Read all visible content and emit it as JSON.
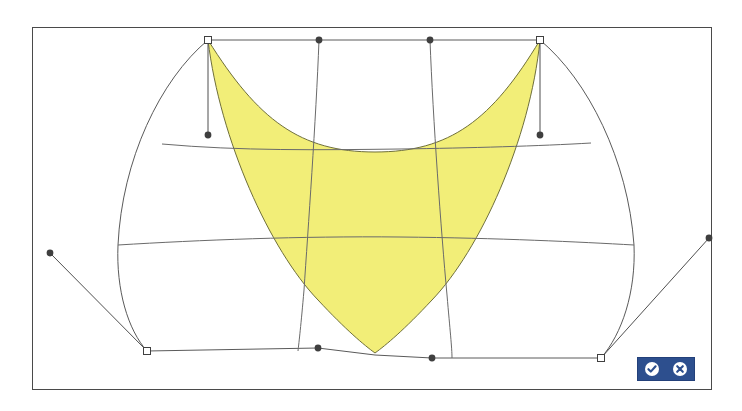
{
  "app": {
    "title": "Surface Patch Editor",
    "canvas_label": "nurbs-surface-canvas"
  },
  "canvas": {
    "frame": {
      "x": 32,
      "y": 27,
      "width": 680,
      "height": 363,
      "border_color": "#4a4a4a"
    },
    "background_color": "#ffffff"
  },
  "toolbar": {
    "name": "confirm-cancel-toolbar",
    "background_color": "#2d4f8e",
    "accept_label": "Accept",
    "accept_icon": "check-circle-icon",
    "cancel_label": "Cancel",
    "cancel_icon": "close-circle-icon",
    "icon_color": "#ffffff"
  },
  "geometry": {
    "selected_patch": {
      "name": "highlighted-surface-patch",
      "fill_color": "#f2ee78",
      "stroke_color": "#6f6f3a",
      "path": "M 208 40 C 258 120 300 152 375 152 C 450 152 492 120 540 40 C 530 140 480 250 432 300 C 404 330 386 345 375 353 C 364 345 346 330 318 300 C 270 250 220 140 208 40 Z"
    },
    "outer_boundary": {
      "name": "surface-outer-boundary",
      "stroke_color": "#5a5a5a",
      "left_path": "M 208 40 C 160 80 122 160 118 245 C 116 290 128 330 147 351",
      "right_path": "M 540 40 C 588 80 628 160 634 245 C 636 292 622 334 601 358",
      "top_path": "M 208 40 L 540 40",
      "bottom_path": "M 147 351 L 318 348 L 375 355 L 432 358 L 601 358"
    },
    "grid_lines": {
      "name": "surface-isoparm-grid",
      "stroke_color": "#6a6a6a",
      "horizontals": [
        "M 162 144 C 240 151 320 150 400 149 C 470 148 540 146 591 143",
        "M 118 245 C 200 240 300 236 400 237 C 500 238 580 242 634 245"
      ],
      "verticals": [
        "M 319 40 C 316 120 308 230 304 290 C 301 325 299 342 298 351",
        "M 430 40 C 433 120 441 230 447 295 C 450 330 452 348 452 358"
      ]
    },
    "control_points": {
      "name": "surface-control-points",
      "square_fill": "#ffffff",
      "square_stroke": "#404040",
      "dot_fill": "#3f3f3f",
      "squares": [
        {
          "id": "cp-top-left",
          "x": 208,
          "y": 40
        },
        {
          "id": "cp-top-right",
          "x": 540,
          "y": 40
        },
        {
          "id": "cp-bottom-left",
          "x": 147,
          "y": 351
        },
        {
          "id": "cp-bottom-right",
          "x": 601,
          "y": 358
        }
      ],
      "dots": [
        {
          "id": "handle-top-inner-left",
          "x": 319,
          "y": 40
        },
        {
          "id": "handle-top-inner-right",
          "x": 430,
          "y": 40
        },
        {
          "id": "handle-left-tangent",
          "x": 208,
          "y": 135
        },
        {
          "id": "handle-right-tangent",
          "x": 540,
          "y": 135
        },
        {
          "id": "handle-far-left",
          "x": 50,
          "y": 253
        },
        {
          "id": "handle-far-right",
          "x": 709,
          "y": 238
        },
        {
          "id": "handle-bottom-inner-left",
          "x": 318,
          "y": 348
        },
        {
          "id": "handle-bottom-inner-right",
          "x": 432,
          "y": 358
        }
      ]
    },
    "tangent_handles": {
      "name": "tangent-handle-lines",
      "stroke_color": "#4f4f4f",
      "lines": [
        "M 208 40 L 208 135",
        "M 540 40 L 540 135",
        "M 50 253 L 147 351",
        "M 709 238 L 601 358"
      ]
    }
  }
}
